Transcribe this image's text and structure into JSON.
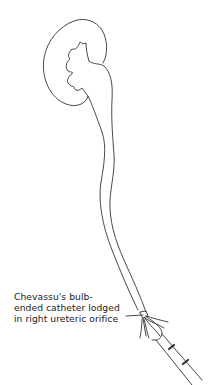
{
  "diagram": {
    "stroke_color": "#333333",
    "background": "#ffffff",
    "annotation": {
      "lines": [
        "Chevassu's bulb-",
        "ended catheter lodged",
        "in right ureteric orifice"
      ]
    },
    "parts": [
      "kidney",
      "renal-calyces",
      "ureter",
      "bulb-ended-catheter",
      "cystoscope"
    ]
  }
}
